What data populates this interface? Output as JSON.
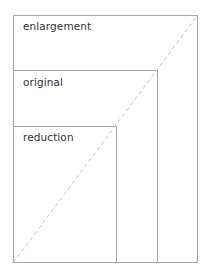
{
  "diagram": {
    "title": "",
    "colors": {
      "rect_stroke": "#a6a6a6",
      "diagonal": "#bdbdbd",
      "text": "#333333",
      "background": "#ffffff"
    },
    "rects": [
      {
        "id": "enlargement",
        "label": "enlargement",
        "x": 13,
        "y": 15,
        "w": 184,
        "h": 247
      },
      {
        "id": "original",
        "label": "original",
        "x": 13,
        "y": 70,
        "w": 144,
        "h": 192
      },
      {
        "id": "reduction",
        "label": "reduction",
        "x": 13,
        "y": 126,
        "w": 103,
        "h": 136
      }
    ],
    "diagonal": {
      "style": "dashed",
      "from": [
        13,
        262
      ],
      "to": [
        197,
        15
      ]
    }
  }
}
